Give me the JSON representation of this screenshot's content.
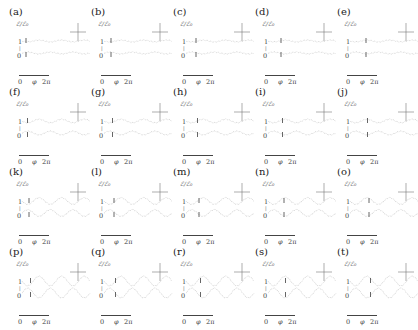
{
  "figure": {
    "layout": {
      "rows": 4,
      "cols": 5
    },
    "y_axis_label": "ℰ/ℰ₀",
    "y_ticks": [
      "1",
      "0"
    ],
    "y_mid_tick": "|",
    "x_axis_labels": {
      "start": "0",
      "symbol": "φ",
      "end": "2π"
    },
    "panels": [
      {
        "label": "(a)",
        "amp": 0.15
      },
      {
        "label": "(b)",
        "amp": 0.15
      },
      {
        "label": "(c)",
        "amp": 0.15
      },
      {
        "label": "(d)",
        "amp": 0.15
      },
      {
        "label": "(e)",
        "amp": 0.15
      },
      {
        "label": "(f)",
        "amp": 0.3
      },
      {
        "label": "(g)",
        "amp": 0.3
      },
      {
        "label": "(h)",
        "amp": 0.3
      },
      {
        "label": "(i)",
        "amp": 0.3
      },
      {
        "label": "(j)",
        "amp": 0.3
      },
      {
        "label": "(k)",
        "amp": 0.55
      },
      {
        "label": "(l)",
        "amp": 0.55
      },
      {
        "label": "(m)",
        "amp": 0.55
      },
      {
        "label": "(n)",
        "amp": 0.55
      },
      {
        "label": "(o)",
        "amp": 0.55
      },
      {
        "label": "(p)",
        "amp": 0.8
      },
      {
        "label": "(q)",
        "amp": 0.8
      },
      {
        "label": "(r)",
        "amp": 0.8
      },
      {
        "label": "(s)",
        "amp": 0.8
      },
      {
        "label": "(t)",
        "amp": 0.8
      }
    ],
    "colors": {
      "curve": "#c8c8c8",
      "marker": "#555555",
      "crosshair": "#777777",
      "text": "#333333"
    }
  }
}
